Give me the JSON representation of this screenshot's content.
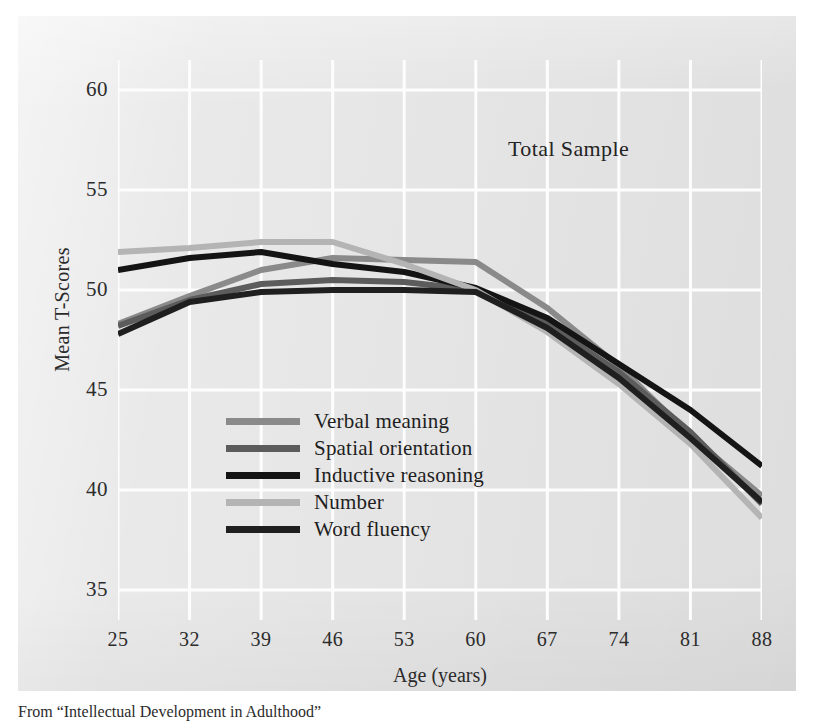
{
  "annotation": {
    "total_sample": "Total Sample"
  },
  "axes": {
    "y_title": "Mean T-Scores",
    "x_title": "Age (years)",
    "y_ticks": [
      "60",
      "55",
      "50",
      "45",
      "40",
      "35"
    ],
    "x_ticks": [
      "25",
      "32",
      "39",
      "46",
      "53",
      "60",
      "67",
      "74",
      "81",
      "88"
    ]
  },
  "legend": {
    "items": [
      {
        "label": "Verbal meaning",
        "color": "#8a8a8a"
      },
      {
        "label": "Spatial orientation",
        "color": "#5c5c5c"
      },
      {
        "label": "Inductive reasoning",
        "color": "#141414"
      },
      {
        "label": "Number",
        "color": "#b4b4b4"
      },
      {
        "label": "Word fluency",
        "color": "#1f1f1f"
      }
    ]
  },
  "caption": {
    "text": "From “Intellectual Development in Adulthood”"
  },
  "colors": {
    "plate_background": "#e7e7e7",
    "grid_line": "#fdfdfd",
    "text": "#2b2b2b"
  },
  "chart_data": {
    "type": "line",
    "title": "Total Sample",
    "xlabel": "Age (years)",
    "ylabel": "Mean T-Scores",
    "x": [
      25,
      32,
      39,
      46,
      53,
      60,
      67,
      74,
      81,
      88
    ],
    "xlim": [
      25,
      88
    ],
    "ylim": [
      33.5,
      61.5
    ],
    "yticks": [
      35,
      40,
      45,
      50,
      55,
      60
    ],
    "xticks": [
      25,
      32,
      39,
      46,
      53,
      60,
      67,
      74,
      81,
      88
    ],
    "grid": true,
    "legend_position": "center-left-inside",
    "series": [
      {
        "name": "Verbal meaning",
        "color": "#8a8a8a",
        "values": [
          48.3,
          49.7,
          51.0,
          51.6,
          51.5,
          51.4,
          49.1,
          46.2,
          42.7,
          39.7
        ]
      },
      {
        "name": "Spatial orientation",
        "color": "#5c5c5c",
        "values": [
          48.2,
          49.5,
          50.3,
          50.5,
          50.4,
          50.0,
          48.3,
          45.9,
          42.9,
          39.3
        ]
      },
      {
        "name": "Inductive reasoning",
        "color": "#141414",
        "values": [
          51.0,
          51.6,
          51.9,
          51.3,
          50.9,
          50.1,
          48.6,
          46.3,
          44.0,
          41.2
        ]
      },
      {
        "name": "Number",
        "color": "#b4b4b4",
        "values": [
          51.9,
          52.1,
          52.4,
          52.4,
          51.3,
          50.0,
          47.9,
          45.3,
          42.3,
          38.6
        ]
      },
      {
        "name": "Word fluency",
        "color": "#1f1f1f",
        "values": [
          47.8,
          49.4,
          49.9,
          50.0,
          50.0,
          49.9,
          48.1,
          45.6,
          42.6,
          39.4
        ]
      }
    ]
  }
}
